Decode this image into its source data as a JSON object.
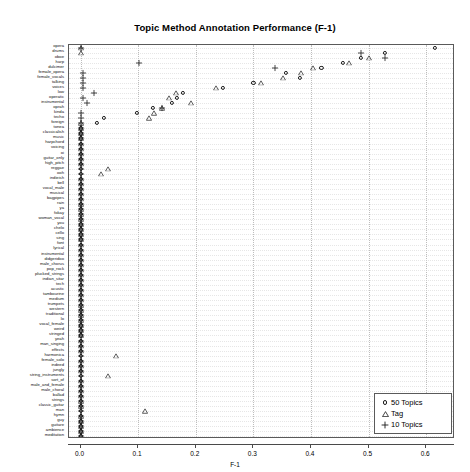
{
  "chart_data": {
    "type": "scatter",
    "title": "Topic Method Annotation Performance (F-1)",
    "xlabel": "F-1",
    "ylabel": "",
    "xlim": [
      -0.02,
      0.65
    ],
    "xticks": [
      "0.0",
      "0.1",
      "0.2",
      "0.3",
      "0.4",
      "0.5",
      "0.6"
    ],
    "xtickvalues": [
      0.0,
      0.1,
      0.2,
      0.3,
      0.4,
      0.5,
      0.6
    ],
    "grid": true,
    "legend_position": "bottom-right",
    "legend": [
      {
        "name": "50 Topics",
        "marker": "circle"
      },
      {
        "name": "Tag",
        "marker": "triangle"
      },
      {
        "name": "10 Topics",
        "marker": "plus"
      }
    ],
    "categories": [
      "opera",
      "drums",
      "oboe",
      "harp",
      "dulcimer",
      "female_opera",
      "female_vocals",
      "talking",
      "voices",
      "low",
      "operatic",
      "instrumental",
      "oprah",
      "kinda",
      "techo",
      "foreign",
      "tonea",
      "classicalish",
      "music",
      "harpchord",
      "voicing",
      "oi",
      "guitar_only",
      "high_pitch",
      "reggae",
      "ooh",
      "indieish",
      "bell",
      "vocal_male",
      "musical",
      "bagpipes",
      "rain",
      "ya",
      "fokay",
      "woman_vocal",
      "you",
      "chelo",
      "cello",
      "sing",
      "font",
      "lyrical",
      "instrumental",
      "didgeridoo",
      "male_chorus",
      "pop_rock",
      "plucked_strings",
      "indian_sitar",
      "tech",
      "acustic",
      "tambourine",
      "medium",
      "trumpets",
      "western",
      "traditional",
      "lo",
      "vocal_female",
      "weird",
      "stringed",
      "yeah",
      "man_singing",
      "effects",
      "harmonica",
      "female_solo",
      "indeed",
      "jungly",
      "string_instruments",
      "sort_of",
      "male_and_female",
      "male_choral",
      "ballad",
      "strings",
      "classic_guitar",
      "man",
      "hymn",
      "guy",
      "guitare",
      "ambience",
      "meditation"
    ],
    "series": [
      {
        "name": "50 Topics",
        "marker": "circle",
        "points": [
          {
            "category": "opera",
            "value": 0.615
          },
          {
            "category": "drums",
            "value": 0.528
          },
          {
            "category": "oboe",
            "value": 0.487
          },
          {
            "category": "harp",
            "value": 0.455
          },
          {
            "category": "dulcimer",
            "value": 0.418
          },
          {
            "category": "female_opera",
            "value": 0.356
          },
          {
            "category": "female_vocals",
            "value": 0.381
          },
          {
            "category": "talking",
            "value": 0.3
          },
          {
            "category": "voices",
            "value": 0.247
          },
          {
            "category": "low",
            "value": 0.178
          },
          {
            "category": "operatic",
            "value": 0.168
          },
          {
            "category": "instrumental",
            "value": 0.159
          },
          {
            "category": "oprah",
            "value": 0.125
          },
          {
            "category": "kinda",
            "value": 0.098
          },
          {
            "category": "techo",
            "value": 0.04
          },
          {
            "category": "foreign",
            "value": 0.028
          }
        ]
      },
      {
        "name": "Tag",
        "marker": "triangle",
        "points": [
          {
            "category": "oboe",
            "value": 0.5
          },
          {
            "category": "harp",
            "value": 0.466
          },
          {
            "category": "dulcimer",
            "value": 0.404
          },
          {
            "category": "female_opera",
            "value": 0.383
          },
          {
            "category": "female_vocals",
            "value": 0.352
          },
          {
            "category": "talking",
            "value": 0.314
          },
          {
            "category": "voices",
            "value": 0.236
          },
          {
            "category": "low",
            "value": 0.166
          },
          {
            "category": "operatic",
            "value": 0.154
          },
          {
            "category": "instrumental",
            "value": 0.192
          },
          {
            "category": "oprah",
            "value": 0.141
          },
          {
            "category": "kinda",
            "value": 0.128
          },
          {
            "category": "techo",
            "value": 0.118
          },
          {
            "category": "reggae",
            "value": 0.048
          },
          {
            "category": "ooh",
            "value": 0.035
          },
          {
            "category": "harmonica",
            "value": 0.062
          },
          {
            "category": "string_instruments",
            "value": 0.047
          },
          {
            "category": "man",
            "value": 0.112
          }
        ]
      },
      {
        "name": "10 Topics",
        "marker": "plus",
        "points": [
          {
            "category": "drums",
            "value": 0.487
          },
          {
            "category": "oboe",
            "value": 0.528
          },
          {
            "category": "harp",
            "value": 0.101
          },
          {
            "category": "dulcimer",
            "value": 0.338
          },
          {
            "category": "female_opera",
            "value": 0.005
          },
          {
            "category": "female_vocals",
            "value": 0.005
          },
          {
            "category": "talking",
            "value": 0.005
          },
          {
            "category": "voices",
            "value": 0.005
          },
          {
            "category": "low",
            "value": 0.024
          },
          {
            "category": "operatic",
            "value": 0.005
          },
          {
            "category": "instrumental",
            "value": 0.012
          },
          {
            "category": "oprah",
            "value": 0.142
          }
        ]
      }
    ],
    "flat_column_x": 0.0,
    "note": "Most categories have flat/zero values stacked at x=0.0 forming a dense column of overlapping markers"
  },
  "legend": {
    "items": [
      {
        "label": "50 Topics",
        "symbol": "circle"
      },
      {
        "label": "Tag",
        "symbol": "triangle"
      },
      {
        "label": "10 Topics",
        "symbol": "plus"
      }
    ]
  }
}
